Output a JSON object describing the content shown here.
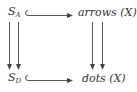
{
  "diagram": {
    "type": "commutative-diagram",
    "nodes": {
      "top_left": {
        "base": "S",
        "subscript": "A"
      },
      "top_right": {
        "label": "arrows (X)"
      },
      "bottom_left": {
        "base": "S",
        "subscript": "D"
      },
      "bottom_right": {
        "label": "dots (X)"
      }
    },
    "edges": [
      {
        "from": "top_left",
        "to": "top_right",
        "style": "hook-inclusion"
      },
      {
        "from": "bottom_left",
        "to": "bottom_right",
        "style": "hook-inclusion"
      },
      {
        "from": "top_left",
        "to": "bottom_left",
        "style": "double-parallel-arrows"
      },
      {
        "from": "top_right",
        "to": "bottom_right",
        "style": "double-parallel-arrows"
      }
    ],
    "colors": {
      "stroke": "#444444",
      "text": "#333333"
    }
  }
}
